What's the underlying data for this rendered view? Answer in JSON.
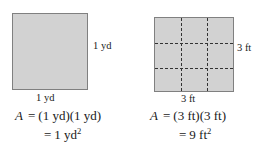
{
  "figures": [
    {
      "id": "yard-square",
      "shape": "square",
      "fill_color": "#d2d2d2",
      "border_color": "#808080",
      "grid": false,
      "labels": {
        "side": "1 yd",
        "bottom": "1 yd"
      },
      "equation": {
        "line1_variable": "A",
        "line1_sign": "=",
        "line1_expression": "(1 yd)(1 yd)",
        "line2_sign": "=",
        "line2_value": "1 yd",
        "line2_exponent": "2"
      }
    },
    {
      "id": "foot-square",
      "shape": "square",
      "fill_color": "#d2d2d2",
      "border_color": "#808080",
      "grid": true,
      "grid_divisions": 3,
      "grid_line_color": "#333333",
      "grid_line_style": "dashed",
      "labels": {
        "side": "3 ft",
        "bottom": "3 ft"
      },
      "equation": {
        "line1_variable": "A",
        "line1_sign": "=",
        "line1_expression": "(3 ft)(3 ft)",
        "line2_sign": "=",
        "line2_value": "9 ft",
        "line2_exponent": "2"
      }
    }
  ]
}
